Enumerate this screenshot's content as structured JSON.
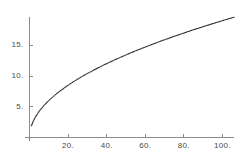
{
  "chart_data": {
    "type": "line",
    "title": "",
    "subtitle": "",
    "xlabel": "",
    "ylabel": "",
    "style": "dotted",
    "grid": false,
    "legend": null,
    "series_color": "#2b2b2b",
    "axis_color": "#8c8c8c",
    "label_color": "#4a4a4a",
    "xlim": [
      0,
      106
    ],
    "ylim": [
      0,
      19.6
    ],
    "x_ticks": [
      {
        "value": 20,
        "label": "20."
      },
      {
        "value": 40,
        "label": "40."
      },
      {
        "value": 60,
        "label": "60."
      },
      {
        "value": 80,
        "label": "80."
      },
      {
        "value": 100,
        "label": "100."
      }
    ],
    "y_ticks": [
      {
        "value": 5,
        "label": "5."
      },
      {
        "value": 10,
        "label": "10."
      },
      {
        "value": 15,
        "label": "15."
      }
    ],
    "series": [
      {
        "name": "curve",
        "x": [
          1,
          2,
          3,
          4,
          5,
          6,
          7,
          8,
          9,
          10,
          12,
          14,
          16,
          18,
          20,
          22,
          24,
          26,
          28,
          30,
          33,
          36,
          39,
          42,
          45,
          48,
          51,
          54,
          57,
          60,
          64,
          68,
          72,
          76,
          80,
          84,
          88,
          92,
          96,
          100,
          104,
          106
        ],
        "y": [
          1.9,
          2.69,
          3.29,
          3.8,
          4.25,
          4.65,
          5.03,
          5.37,
          5.7,
          6.01,
          6.58,
          7.11,
          7.6,
          8.06,
          8.5,
          8.91,
          9.31,
          9.69,
          10.06,
          10.41,
          10.91,
          11.4,
          11.86,
          12.31,
          12.75,
          13.16,
          13.57,
          13.96,
          14.34,
          14.72,
          15.2,
          15.67,
          16.12,
          16.56,
          16.99,
          17.42,
          17.82,
          18.22,
          18.62,
          19.0,
          19.38,
          19.56
        ]
      }
    ]
  }
}
